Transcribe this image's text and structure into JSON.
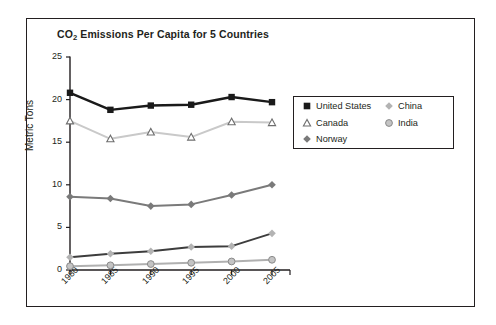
{
  "chart_data": {
    "type": "line",
    "title": "CO2 Emissions Per Capita for 5 Countries",
    "title_main": "CO",
    "title_sub": "2",
    "title_rest": " Emissions Per Capita for 5 Countries",
    "xlabel": "",
    "ylabel": "Metric Tons",
    "categories": [
      "1980",
      "1985",
      "1990",
      "1995",
      "2000",
      "2005"
    ],
    "ylim": [
      0,
      25
    ],
    "yticks": [
      0,
      5,
      10,
      15,
      20,
      25
    ],
    "ytick_labels": [
      "0",
      "5",
      "10",
      "15",
      "20",
      "25"
    ],
    "grid": false,
    "legend_position": "upper right, outside plot",
    "series": [
      {
        "name": "United States",
        "marker": "filled-square",
        "color": "#1a1a1a",
        "values": [
          20.8,
          18.8,
          19.3,
          19.4,
          20.3,
          19.7
        ]
      },
      {
        "name": "Canada",
        "marker": "open-triangle",
        "color": "#c9c9c9",
        "marker_color": "#ffffff",
        "marker_stroke": "#6e6e6e",
        "values": [
          17.5,
          15.4,
          16.2,
          15.6,
          17.4,
          17.3
        ]
      },
      {
        "name": "Norway",
        "marker": "filled-diamond",
        "color": "#7a7a7a",
        "values": [
          8.6,
          8.4,
          7.5,
          7.7,
          8.8,
          10.0
        ]
      },
      {
        "name": "China",
        "marker": "filled-diamond-light",
        "color": "#3d3d3d",
        "marker_color": "#b3b3b3",
        "values": [
          1.5,
          1.9,
          2.2,
          2.7,
          2.8,
          4.3
        ]
      },
      {
        "name": "India",
        "marker": "circle",
        "color": "#b0b0b0",
        "marker_color": "#c4c4c4",
        "marker_stroke": "#8a8a8a",
        "values": [
          0.45,
          0.55,
          0.7,
          0.85,
          1.0,
          1.2
        ]
      }
    ]
  },
  "legend": {
    "entries": [
      {
        "label": "United States"
      },
      {
        "label": "Canada"
      },
      {
        "label": "Norway"
      },
      {
        "label": "China"
      },
      {
        "label": "India"
      }
    ]
  },
  "colors": {
    "frame": "#231f20",
    "axis": "#231f20",
    "background": "#ffffff",
    "text": "#231f20"
  }
}
